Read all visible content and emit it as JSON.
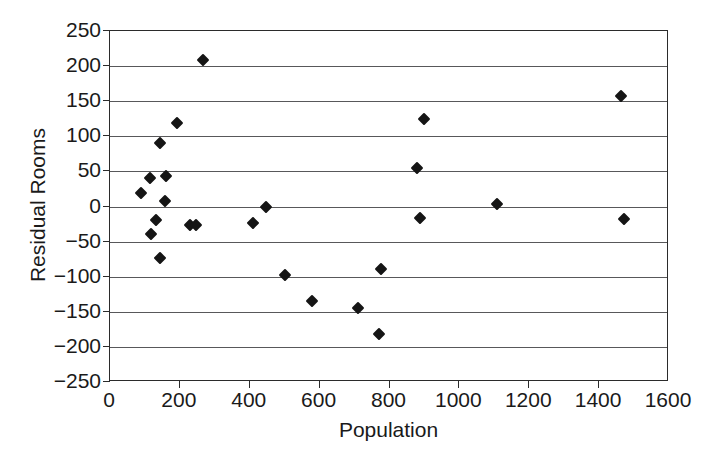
{
  "chart_data": {
    "type": "scatter",
    "title": "",
    "xlabel": "Population",
    "ylabel": "Residual Rooms",
    "xlim": [
      0,
      1600
    ],
    "ylim": [
      -250,
      250
    ],
    "xticks": [
      0,
      200,
      400,
      600,
      800,
      1000,
      1200,
      1400,
      1600
    ],
    "yticks": [
      -250,
      -200,
      -150,
      -100,
      -50,
      0,
      50,
      100,
      150,
      200,
      250
    ],
    "grid": "horizontal",
    "legend": "none",
    "marker": "filled-diamond",
    "marker_color": "#151515",
    "points": [
      {
        "x": 88,
        "y": 19
      },
      {
        "x": 115,
        "y": 40
      },
      {
        "x": 118,
        "y": -39
      },
      {
        "x": 131,
        "y": -19
      },
      {
        "x": 143,
        "y": 91
      },
      {
        "x": 144,
        "y": -74
      },
      {
        "x": 157,
        "y": 8
      },
      {
        "x": 160,
        "y": 43
      },
      {
        "x": 192,
        "y": 119
      },
      {
        "x": 230,
        "y": -26
      },
      {
        "x": 245,
        "y": -26
      },
      {
        "x": 267,
        "y": 209
      },
      {
        "x": 410,
        "y": -23
      },
      {
        "x": 447,
        "y": 0
      },
      {
        "x": 502,
        "y": -97
      },
      {
        "x": 578,
        "y": -134
      },
      {
        "x": 710,
        "y": -145
      },
      {
        "x": 770,
        "y": -181
      },
      {
        "x": 775,
        "y": -89
      },
      {
        "x": 880,
        "y": 55
      },
      {
        "x": 888,
        "y": -16
      },
      {
        "x": 898,
        "y": 125
      },
      {
        "x": 1108,
        "y": 4
      },
      {
        "x": 1462,
        "y": 158
      },
      {
        "x": 1470,
        "y": -18
      }
    ]
  }
}
